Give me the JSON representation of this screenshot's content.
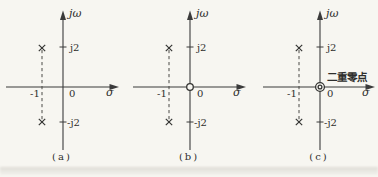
{
  "figure": {
    "background_color": "#f7f6f1",
    "ink_color": "#3b3b3b",
    "panels": [
      {
        "caption": "(a)",
        "vertical_axis_label": "jω",
        "horizontal_axis_label": "σ",
        "origin_label": "0",
        "upper_tick_label": "j2",
        "lower_tick_label": "-j2",
        "real_tick_label": "-1",
        "poles": [
          "-1+j2",
          "-1-j2"
        ],
        "zeros": []
      },
      {
        "caption": "(b)",
        "vertical_axis_label": "jω",
        "horizontal_axis_label": "σ",
        "origin_label": "0",
        "upper_tick_label": "j2",
        "lower_tick_label": "-j2",
        "real_tick_label": "-1",
        "poles": [
          "-1+j2",
          "-1-j2"
        ],
        "zeros": [
          "0"
        ]
      },
      {
        "caption": "(c)",
        "vertical_axis_label": "jω",
        "horizontal_axis_label": "σ",
        "origin_label": "0",
        "upper_tick_label": "j2",
        "lower_tick_label": "-j2",
        "real_tick_label": "-1",
        "poles": [
          "-1+j2",
          "-1-j2"
        ],
        "zeros": [
          "0",
          "0"
        ],
        "annotation": "二重零点"
      }
    ]
  }
}
